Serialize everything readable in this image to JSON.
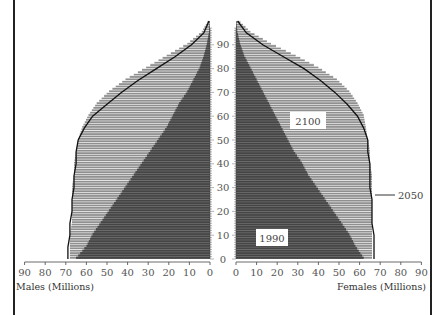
{
  "chart_data": {
    "type": "bar",
    "subtype": "population-pyramid",
    "title": "",
    "xlabel_left": "Males (Millions)",
    "xlabel_right": "Females (Millions)",
    "ylabel": "Age",
    "x_ticks": [
      0,
      10,
      20,
      30,
      40,
      50,
      60,
      70,
      80,
      90
    ],
    "y_ticks": [
      0,
      10,
      20,
      30,
      40,
      50,
      60,
      70,
      80,
      90
    ],
    "xlim": [
      0,
      90
    ],
    "ylim": [
      0,
      100
    ],
    "grid": false,
    "legend": "inline labels",
    "series_labels": [
      {
        "name": "1990",
        "style": "dark solid fill",
        "position": "lower right, inside"
      },
      {
        "name": "2050",
        "style": "black outline line",
        "position": "right of pyramid with leader line"
      },
      {
        "name": "2100",
        "style": "light hatched fill",
        "position": "upper right, inside"
      }
    ],
    "ages": [
      0,
      5,
      10,
      15,
      20,
      25,
      30,
      35,
      40,
      45,
      50,
      55,
      60,
      65,
      70,
      75,
      80,
      85,
      90,
      95,
      100
    ],
    "series": [
      {
        "name": "1990",
        "males": [
          65,
          60,
          57,
          53,
          49,
          45,
          41,
          37,
          33,
          29,
          25,
          21,
          18,
          15,
          11,
          8,
          5,
          3,
          1.5,
          0.5,
          0.1
        ],
        "females": [
          62,
          58,
          55,
          51,
          47,
          43,
          39,
          35,
          32,
          28,
          25,
          22,
          19,
          16,
          13,
          10,
          7,
          4,
          2,
          0.7,
          0.1
        ]
      },
      {
        "name": "2050",
        "males": [
          69,
          69,
          68,
          68,
          67,
          67,
          66,
          66,
          65,
          65,
          64,
          61,
          57,
          50,
          43,
          35,
          26,
          17,
          9,
          3,
          0.5
        ],
        "females": [
          67,
          67,
          67,
          66,
          66,
          66,
          65,
          65,
          65,
          64,
          64,
          62,
          59,
          54,
          48,
          41,
          33,
          23,
          13,
          5,
          0.8
        ]
      },
      {
        "name": "2100",
        "males": [
          68,
          68,
          68,
          67,
          67,
          67,
          67,
          66,
          66,
          65,
          64,
          62,
          59,
          55,
          49,
          41,
          31,
          21,
          11,
          4,
          0.7
        ],
        "females": [
          66,
          66,
          66,
          66,
          66,
          66,
          66,
          66,
          65,
          65,
          64,
          63,
          62,
          59,
          55,
          49,
          40,
          29,
          17,
          7,
          1
        ]
      }
    ]
  },
  "labels": {
    "male_axis_title": "Males (Millions)",
    "female_axis_title": "Females (Millions)",
    "label_1990": "1990",
    "label_2050": "2050",
    "label_2100": "2100"
  },
  "colors": {
    "fill_1990": "#4a4a4a",
    "fill_2100": "#9a9a9a",
    "outline_2050": "#111111",
    "axis": "#444444",
    "text": "#555555"
  }
}
